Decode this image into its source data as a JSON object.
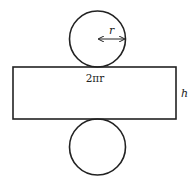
{
  "diagram": {
    "labels": {
      "radius": "r",
      "circumference": "2πr",
      "height": "h"
    },
    "colors": {
      "stroke": "#222222",
      "background": "#ffffff"
    },
    "shapes": {
      "top_circle": {
        "cx": 97.5,
        "cy": 39,
        "r": 28
      },
      "rectangle": {
        "x": 13,
        "y": 67,
        "width": 163,
        "height": 52
      },
      "bottom_circle": {
        "cx": 97.5,
        "cy": 147,
        "r": 28
      },
      "radius_arrow": {
        "x1": 98,
        "x2": 125,
        "y": 39
      }
    }
  }
}
